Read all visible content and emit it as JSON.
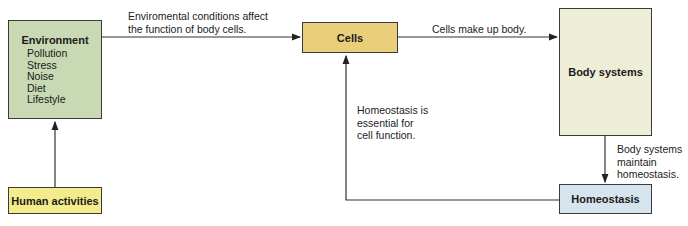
{
  "diagram": {
    "nodes": {
      "environment": {
        "title": "Environment",
        "items": [
          "Pollution",
          "Stress",
          "Noise",
          "Diet",
          "Lifestyle"
        ],
        "color": "#c8d9b4"
      },
      "human_activities": {
        "title": "Human activities",
        "color": "#f3ec8c"
      },
      "cells": {
        "title": "Cells",
        "color": "#e9cf7a"
      },
      "body_systems": {
        "title": "Body systems",
        "color": "#eeeed6"
      },
      "homeostasis": {
        "title": "Homeostasis",
        "color": "#d6e4ee"
      }
    },
    "edges": {
      "env_to_cells": {
        "line1": "Enviromental conditions affect",
        "line2": "the function of body cells."
      },
      "cells_to_body": {
        "text": "Cells make up body."
      },
      "body_to_homeo": {
        "line1": "Body systems",
        "line2": "maintain",
        "line3": "homeostasis."
      },
      "homeo_to_cells": {
        "line1": "Homeostasis is",
        "line2": "essential for",
        "line3": "cell function."
      }
    }
  }
}
